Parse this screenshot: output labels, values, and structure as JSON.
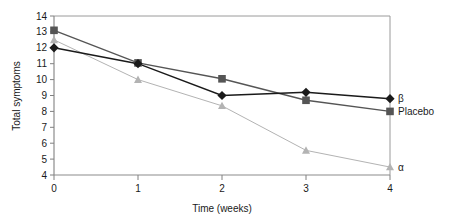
{
  "chart_data": {
    "type": "line",
    "title": "",
    "xlabel": "Time (weeks)",
    "ylabel": "Total symptoms",
    "x": [
      0,
      1,
      2,
      3,
      4
    ],
    "xtick_labels": [
      "0",
      "1",
      "2",
      "3",
      "4"
    ],
    "ytick_labels": [
      "4",
      "5",
      "6",
      "7",
      "8",
      "9",
      "10",
      "11",
      "12",
      "13",
      "14"
    ],
    "yticks": [
      4,
      5,
      6,
      7,
      8,
      9,
      10,
      11,
      12,
      13,
      14
    ],
    "xlim": [
      0,
      4
    ],
    "ylim": [
      4,
      14
    ],
    "grid": false,
    "legend_position": "right-inline",
    "series": [
      {
        "name": "β",
        "label": "β",
        "marker": "diamond",
        "color": "#1a1a1a",
        "values": [
          12.0,
          11.0,
          9.0,
          9.2,
          8.8
        ]
      },
      {
        "name": "Placebo",
        "label": "Placebo",
        "marker": "square",
        "color": "#555555",
        "values": [
          13.1,
          11.05,
          10.05,
          8.7,
          8.0
        ]
      },
      {
        "name": "α",
        "label": "α",
        "marker": "triangle",
        "color": "#b3b3b3",
        "values": [
          12.5,
          10.0,
          8.35,
          5.55,
          4.5
        ]
      }
    ]
  },
  "axes": {
    "frame_color": "#999999",
    "tick_color": "#808080"
  }
}
